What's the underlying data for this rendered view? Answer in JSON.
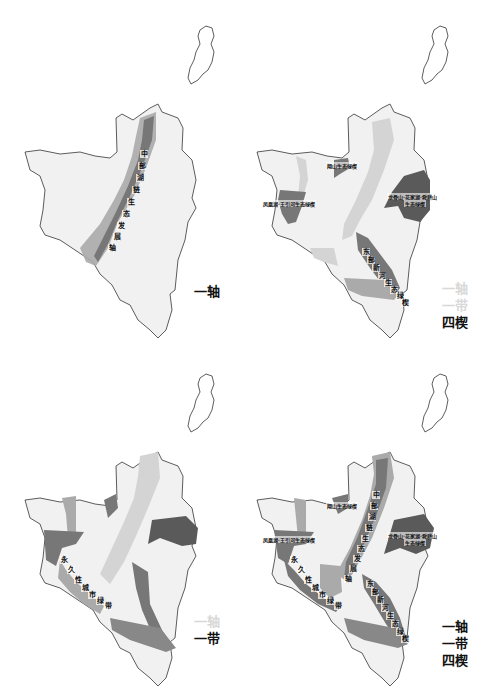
{
  "colors": {
    "outline": "#333333",
    "base_fill": "#f1f1f1",
    "light_zone": "#d4d4d4",
    "mid_zone": "#aaaaaa",
    "dark_zone": "#777777",
    "darkest_zone": "#5a5a5a",
    "text": "#111111",
    "faded_text": "#d8d8d8"
  },
  "panels": [
    {
      "id": "axis",
      "legend": [
        {
          "text": "一轴",
          "faded": false
        }
      ],
      "axis_label_chars": [
        "中",
        "部",
        "湖",
        "链",
        "生",
        "态",
        "发",
        "展",
        "轴"
      ]
    },
    {
      "id": "wedges",
      "legend": [
        {
          "text": "一轴",
          "faded": true
        },
        {
          "text": "一带",
          "faded": true
        },
        {
          "text": "四楔",
          "faded": false
        }
      ],
      "wedge_labels": [
        {
          "text": "翔山生态绿楔"
        },
        {
          "text": "凤凰湖·王引河生态绿楔"
        },
        {
          "text": "龙骨山·花家湖·舜耕山"
        },
        {
          "text": "生态绿楔"
        }
      ],
      "diagonal_label_chars": [
        "东",
        "部",
        "新",
        "河",
        "生",
        "态",
        "绿",
        "楔"
      ]
    },
    {
      "id": "belt",
      "legend": [
        {
          "text": "一轴",
          "faded": true
        },
        {
          "text": "一带",
          "faded": false
        }
      ],
      "belt_label_chars": [
        "永",
        "久",
        "性",
        "城",
        "市",
        "绿",
        "带"
      ]
    },
    {
      "id": "combined",
      "legend": [
        {
          "text": "一轴",
          "faded": false
        },
        {
          "text": "一带",
          "faded": false
        },
        {
          "text": "四楔",
          "faded": false
        }
      ],
      "axis_label_chars": [
        "中",
        "部",
        "湖",
        "链",
        "生",
        "态",
        "发",
        "展",
        "轴"
      ],
      "belt_label_chars": [
        "永",
        "久",
        "性",
        "城",
        "市",
        "绿",
        "带"
      ],
      "wedge_labels": [
        {
          "text": "翔山生态绿楔"
        },
        {
          "text": "凤凰湖·王引河生态绿楔"
        },
        {
          "text": "龙骨山·花家湖·舜耕山"
        },
        {
          "text": "生态绿楔"
        }
      ],
      "diagonal_label_chars": [
        "东",
        "部",
        "新",
        "河",
        "生",
        "态",
        "绿",
        "楔"
      ]
    }
  ]
}
